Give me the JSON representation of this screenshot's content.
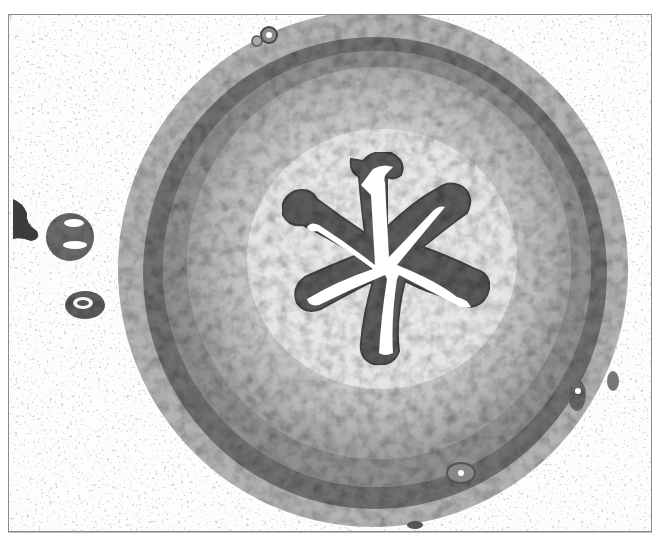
{
  "image": {
    "kind": "histology-micrograph",
    "subject": "cross-section of tubular organ with stellate lumen",
    "colors": {
      "background": "#fdfdfd",
      "frame_border": "#8a8a8a",
      "muscle_dark": "#6e6e6e",
      "muscle_mid": "#9a9a9a",
      "inner_light": "#cfcfcf",
      "epithelium": "#555555",
      "lumen": "#ffffff"
    }
  }
}
